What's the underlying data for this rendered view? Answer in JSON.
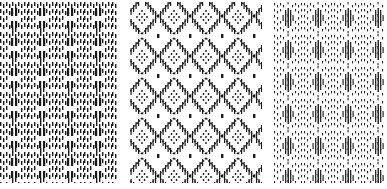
{
  "image": {
    "description": "Three side-by-side black and white woven textile patterns with diamond motifs",
    "background": "#ffffff",
    "ink": "#1a1a1a",
    "panels": [
      {
        "id": "left",
        "motif": "dense dotted lattice with white diamond centers"
      },
      {
        "id": "middle",
        "motif": "bold hatched diamond lattice with dotted diamond centers"
      },
      {
        "id": "right",
        "motif": "fine dotted lattice with hatched diamond centers"
      }
    ]
  }
}
